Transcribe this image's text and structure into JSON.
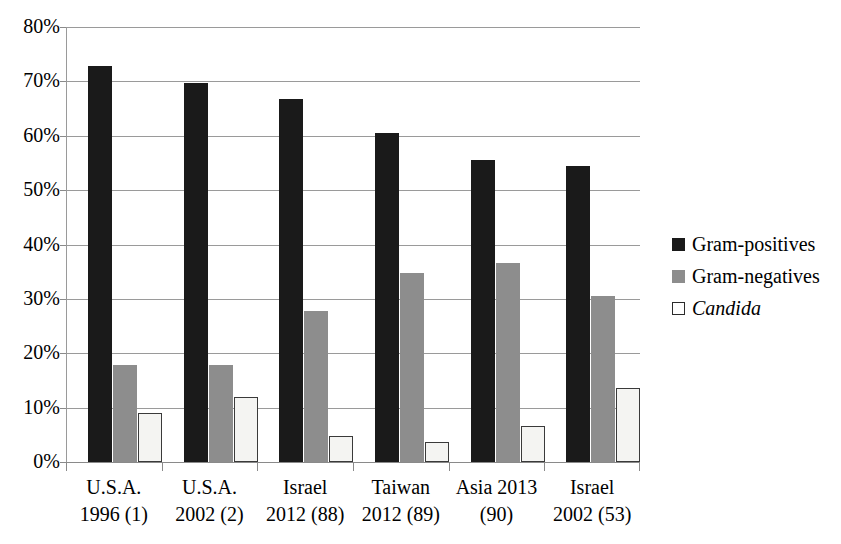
{
  "chart_data": {
    "type": "bar",
    "title": "",
    "subtitle": "",
    "xlabel": "",
    "ylabel": "",
    "ylim": [
      0,
      80
    ],
    "y_tick_labels": [
      "80%",
      "70%",
      "60%",
      "50%",
      "40%",
      "30%",
      "20%",
      "10%",
      "0%"
    ],
    "y_ticks": [
      80,
      70,
      60,
      50,
      40,
      30,
      20,
      10,
      0
    ],
    "grid": true,
    "legend_position": "right",
    "categories": [
      "U.S.A. 1996 (1)",
      "U.S.A. 2002 (2)",
      "Israel 2012 (88)",
      "Taiwan 2012 (89)",
      "Asia 2013 (90)",
      "Israel 2002 (53)"
    ],
    "category_lines": [
      [
        "U.S.A.",
        "1996 (1)"
      ],
      [
        "U.S.A.",
        "2002 (2)"
      ],
      [
        "Israel",
        "2012 (88)"
      ],
      [
        "Taiwan",
        "2012 (89)"
      ],
      [
        "Asia 2013",
        "(90)"
      ],
      [
        "Israel",
        "2002 (53)"
      ]
    ],
    "series": [
      {
        "name": "Gram-positives",
        "color": "#1a1a1a",
        "values": [
          72.9,
          69.7,
          66.7,
          60.6,
          55.6,
          54.5
        ]
      },
      {
        "name": "Gram-negatives",
        "color": "#8d8d8d",
        "values": [
          17.9,
          17.9,
          27.7,
          34.7,
          36.6,
          30.6
        ]
      },
      {
        "name": "Candida",
        "color": "#ffffff",
        "italic": true,
        "values": [
          9.0,
          11.9,
          4.7,
          3.7,
          6.6,
          13.6
        ]
      }
    ]
  },
  "legend": {
    "items": [
      {
        "label": "Gram-positives",
        "swatch": "black-square"
      },
      {
        "label": "Gram-negatives",
        "swatch": "gray-square"
      },
      {
        "label": "Candida",
        "swatch": "white-square"
      }
    ]
  }
}
